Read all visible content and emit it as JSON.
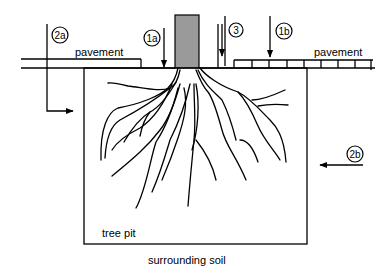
{
  "diagram": {
    "labels": {
      "pavement_left": "pavement",
      "pavement_right": "pavement",
      "tree_pit": "tree pit",
      "surrounding_soil": "surrounding soil"
    },
    "markers": [
      {
        "id": "2a",
        "label": "2a"
      },
      {
        "id": "1a",
        "label": "1a"
      },
      {
        "id": "3",
        "label": "3"
      },
      {
        "id": "1b",
        "label": "1b"
      },
      {
        "id": "2b",
        "label": "2b"
      }
    ],
    "colors": {
      "trunk": "#9a9a9a",
      "line": "#000000",
      "background": "#ffffff"
    }
  }
}
